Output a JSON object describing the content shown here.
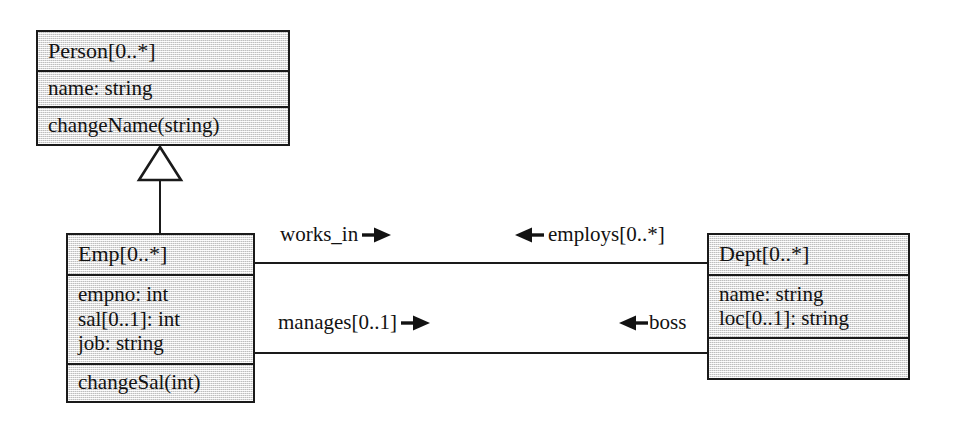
{
  "diagram": {
    "kind": "uml-class-diagram",
    "background_color": "#ffffff",
    "line_color": "#1a1a1a",
    "box_fill_color": "#e9e9e9",
    "text_color": "#121212"
  },
  "classes": [
    {
      "id": "person",
      "name": "Person[0..*]",
      "attributes": [
        "name: string"
      ],
      "operations": [
        "changeName(string)"
      ]
    },
    {
      "id": "emp",
      "name": "Emp[0..*]",
      "attributes": [
        "empno: int",
        "sal[0..1]: int",
        "job: string"
      ],
      "operations": [
        "changeSal(int)"
      ]
    },
    {
      "id": "dept",
      "name": "Dept[0..*]",
      "attributes": [
        "name: string",
        "loc[0..1]: string"
      ],
      "operations": []
    }
  ],
  "relationships": {
    "generalization": {
      "label": "generalization-person-emp",
      "from": "Emp[0..*]",
      "to": "Person[0..*]",
      "arrow": "hollow-triangle"
    },
    "association_works_in": {
      "source_role": "works_in",
      "target_role": "employs[0..*]",
      "source_arrow": "solid-arrow-right",
      "target_arrow": "solid-arrow-left"
    },
    "association_manages": {
      "source_role": "manages[0..1]",
      "target_role": "boss",
      "source_arrow": "solid-arrow-right",
      "target_arrow": "solid-arrow-left"
    }
  }
}
